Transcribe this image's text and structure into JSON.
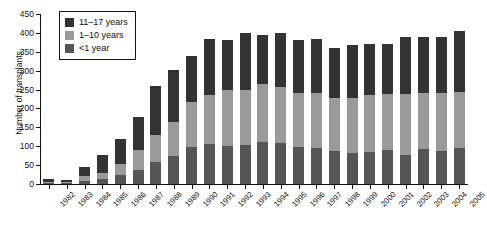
{
  "chart_data": {
    "type": "bar",
    "stacked": true,
    "title": "",
    "xlabel": "",
    "ylabel": "Number of transplants",
    "ylim": [
      0,
      450
    ],
    "ytick_step": 50,
    "yticks": [
      0,
      50,
      100,
      150,
      200,
      250,
      300,
      350,
      400,
      450
    ],
    "grid": false,
    "legend_position": "top-left",
    "categories": [
      "1982",
      "1983",
      "1984",
      "1985",
      "1986",
      "1987",
      "1988",
      "1989",
      "1990",
      "1991",
      "1992",
      "1993",
      "1994",
      "1995",
      "1996",
      "1997",
      "1998",
      "1999",
      "2000",
      "2001",
      "2002",
      "2003",
      "2004",
      "2005"
    ],
    "series": [
      {
        "name": "<1 year",
        "color": "#555555",
        "values": [
          2,
          2,
          8,
          14,
          24,
          38,
          58,
          75,
          98,
          105,
          100,
          102,
          112,
          108,
          98,
          95,
          88,
          82,
          85,
          90,
          78,
          92,
          88,
          96
        ]
      },
      {
        "name": "1–10 years",
        "color": "#9a9a9a",
        "values": [
          4,
          3,
          14,
          16,
          28,
          52,
          72,
          90,
          120,
          130,
          150,
          148,
          152,
          150,
          142,
          145,
          140,
          145,
          150,
          148,
          160,
          150,
          152,
          148
        ]
      },
      {
        "name": "11–17 years",
        "color": "#333333",
        "values": [
          6,
          6,
          23,
          48,
          68,
          88,
          130,
          137,
          122,
          150,
          132,
          150,
          130,
          142,
          142,
          145,
          132,
          140,
          135,
          132,
          152,
          148,
          148,
          162
        ]
      }
    ],
    "totals": [
      12,
      11,
      45,
      78,
      120,
      178,
      260,
      302,
      340,
      385,
      382,
      400,
      394,
      400,
      382,
      385,
      360,
      367,
      370,
      370,
      390,
      390,
      388,
      406
    ]
  },
  "legend": {
    "items": [
      {
        "label": "11–17 years"
      },
      {
        "label": "1–10 years"
      },
      {
        "label": "<1 year"
      }
    ]
  }
}
